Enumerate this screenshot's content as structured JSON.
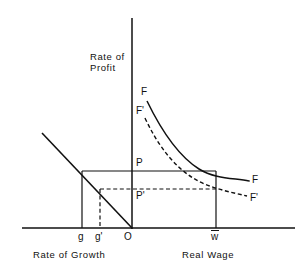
{
  "figure": {
    "type": "economics-diagram",
    "axes": {
      "vertical_label_line1": "Rate of",
      "vertical_label_line2": "Profit",
      "left_quadrant_label": "Rate of Growth",
      "right_quadrant_label": "Real Wage",
      "origin_label": "O"
    },
    "ticks": [
      {
        "name": "g",
        "label": "g"
      },
      {
        "name": "g-prime",
        "label": "g'"
      },
      {
        "name": "origin",
        "label": "O"
      },
      {
        "name": "w-bar",
        "label": "w",
        "overbar": true
      }
    ],
    "curves": [
      {
        "name": "F",
        "style": "solid",
        "label_top": "F",
        "label_right": "F"
      },
      {
        "name": "F-prime",
        "style": "dashed",
        "label_top": "F'",
        "label_right": "F'"
      }
    ],
    "points": [
      {
        "name": "P",
        "label": "P",
        "style": "solid"
      },
      {
        "name": "P-prime",
        "label": "P'",
        "style": "dashed"
      }
    ],
    "colors": {
      "ink": "#111111",
      "background": "#ffffff"
    }
  }
}
